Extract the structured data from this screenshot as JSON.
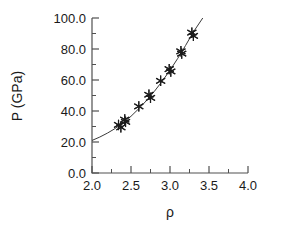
{
  "chart_data": {
    "type": "scatter",
    "title": "",
    "xlabel": "ρ",
    "ylabel": "P (GPa)",
    "xlim": [
      2.0,
      4.0
    ],
    "ylim": [
      0.0,
      100.0
    ],
    "grid": false,
    "legend": null,
    "x_ticks": [
      "2.0",
      "2.5",
      "3.0",
      "3.5",
      "4.0"
    ],
    "x_tick_values": [
      2.0,
      2.5,
      3.0,
      3.5,
      4.0
    ],
    "x_minor_tick_values": [
      2.25,
      2.75,
      3.25,
      3.75
    ],
    "y_ticks": [
      "0.0",
      "20.0",
      "40.0",
      "60.0",
      "80.0",
      "100.0"
    ],
    "y_tick_values": [
      0.0,
      20.0,
      40.0,
      60.0,
      80.0,
      100.0
    ],
    "y_minor_tick_values": [
      10.0,
      30.0,
      50.0,
      70.0,
      90.0
    ],
    "marker_symbol": "asterisk",
    "marker_color": "#1c1c1c",
    "line_color": "#3a3a3a",
    "series": [
      {
        "name": "data points",
        "marker": "asterisk",
        "points": [
          {
            "x": 2.34,
            "y": 31.0
          },
          {
            "x": 2.37,
            "y": 29.5
          },
          {
            "x": 2.42,
            "y": 34.5
          },
          {
            "x": 2.43,
            "y": 33.0
          },
          {
            "x": 2.6,
            "y": 43.0
          },
          {
            "x": 2.73,
            "y": 50.5
          },
          {
            "x": 2.75,
            "y": 48.5
          },
          {
            "x": 2.88,
            "y": 59.5
          },
          {
            "x": 2.99,
            "y": 67.0
          },
          {
            "x": 3.01,
            "y": 65.5
          },
          {
            "x": 3.14,
            "y": 78.5
          },
          {
            "x": 3.15,
            "y": 77.0
          },
          {
            "x": 3.28,
            "y": 90.5
          },
          {
            "x": 3.3,
            "y": 88.5
          }
        ]
      },
      {
        "name": "fitted curve",
        "type": "line",
        "points": [
          {
            "x": 2.0,
            "y": 21.0
          },
          {
            "x": 2.1,
            "y": 23.2
          },
          {
            "x": 2.2,
            "y": 25.8
          },
          {
            "x": 2.3,
            "y": 28.8
          },
          {
            "x": 2.4,
            "y": 32.4
          },
          {
            "x": 2.5,
            "y": 36.6
          },
          {
            "x": 2.6,
            "y": 41.5
          },
          {
            "x": 2.7,
            "y": 46.8
          },
          {
            "x": 2.8,
            "y": 52.7
          },
          {
            "x": 2.9,
            "y": 59.2
          },
          {
            "x": 3.0,
            "y": 66.3
          },
          {
            "x": 3.1,
            "y": 74.0
          },
          {
            "x": 3.2,
            "y": 82.3
          },
          {
            "x": 3.3,
            "y": 91.0
          },
          {
            "x": 3.42,
            "y": 100.0
          }
        ]
      }
    ]
  }
}
